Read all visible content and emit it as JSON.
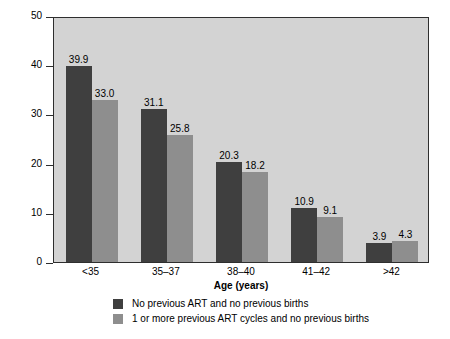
{
  "chart_data": {
    "type": "bar",
    "title": "",
    "xlabel": "Age (years)",
    "ylabel": "Percent",
    "categories": [
      "<35",
      "35–37",
      "38–40",
      "41–42",
      ">42"
    ],
    "series": [
      {
        "name": "No previous ART and no previous births",
        "color": "#3f3f3f",
        "values": [
          39.9,
          31.1,
          20.3,
          10.9,
          3.9
        ],
        "labels": [
          "39.9",
          "31.1",
          "20.3",
          "10.9",
          "3.9"
        ]
      },
      {
        "name": "1 or more previous ART cycles and no previous births",
        "color": "#8e8e8e",
        "values": [
          33.0,
          25.8,
          18.2,
          9.1,
          4.3
        ],
        "labels": [
          "33.0",
          "25.8",
          "18.2",
          "9.1",
          "4.3"
        ]
      }
    ],
    "ylim": [
      0,
      50
    ],
    "yticks": [
      0,
      10,
      20,
      30,
      40,
      50
    ],
    "ytick_labels": [
      "0",
      "10",
      "20",
      "30",
      "40",
      "50"
    ],
    "grid": false,
    "legend_position": "bottom",
    "plot_background": "#d3d3d3",
    "figure_background": "#ffffff",
    "axis_color": "#2e2e2e"
  },
  "legend": {
    "items": [
      {
        "label": "No previous ART and no previous births",
        "swatch": "dark"
      },
      {
        "label": "1 or more previous ART cycles and no previous births",
        "swatch": "light"
      }
    ]
  }
}
